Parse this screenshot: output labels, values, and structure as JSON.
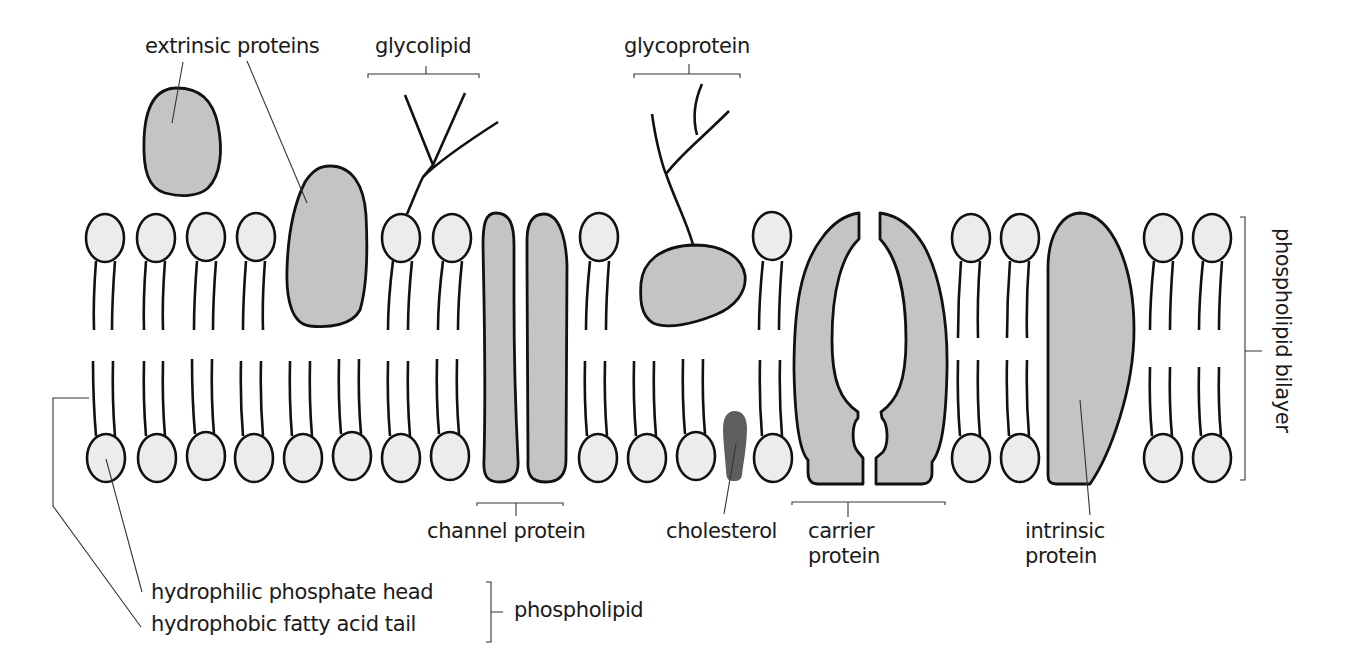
{
  "colors": {
    "protein_fill": "#c4c4c4",
    "head_fill": "#ececec",
    "cholesterol_fill": "#5e5e5e",
    "outline": "#111111",
    "text": "#1a1a1a",
    "background": "#ffffff"
  },
  "labels": {
    "extrinsic_proteins": "extrinsic proteins",
    "glycolipid": "glycolipid",
    "glycoprotein": "glycoprotein",
    "phospholipid_bilayer": "phospholipid bilayer",
    "channel_protein": "channel protein",
    "cholesterol": "cholesterol",
    "carrier_protein": "carrier\nprotein",
    "intrinsic_protein": "intrinsic\nprotein",
    "hydrophilic_head": "hydrophilic phosphate head",
    "hydrophobic_tail": "hydrophobic fatty acid tail",
    "phospholipid": "phospholipid"
  },
  "components": [
    {
      "name": "phospholipid",
      "parts": [
        "hydrophilic phosphate head",
        "hydrophobic fatty acid tail"
      ]
    },
    {
      "name": "extrinsic proteins",
      "count": 2
    },
    {
      "name": "glycolipid"
    },
    {
      "name": "glycoprotein"
    },
    {
      "name": "channel protein"
    },
    {
      "name": "cholesterol"
    },
    {
      "name": "carrier protein"
    },
    {
      "name": "intrinsic protein"
    }
  ]
}
